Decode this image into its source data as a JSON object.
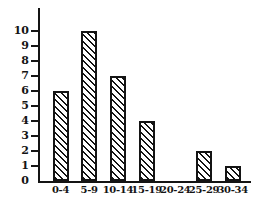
{
  "chart_data": {
    "type": "bar",
    "title": "",
    "xlabel": "",
    "ylabel": "",
    "categories": [
      "0-4",
      "5-9",
      "10-14",
      "15-19",
      "20-24",
      "25-29",
      "30-34"
    ],
    "values": [
      6,
      10,
      7,
      4,
      0,
      2,
      1
    ],
    "ylim": [
      0,
      10
    ],
    "yticks": [
      0,
      1,
      2,
      3,
      4,
      5,
      6,
      7,
      8,
      9,
      10
    ],
    "grid": "off",
    "legend": "none",
    "bar_fill": "diagonal-hatch-backslash",
    "ink_color": "#141414",
    "background_color": "#ffffff"
  }
}
